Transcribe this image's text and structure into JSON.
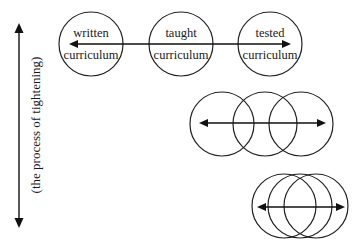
{
  "axis": {
    "label": "(the process of tightening)",
    "direction": "bidirectional-vertical"
  },
  "rows": [
    {
      "name": "separated",
      "circles": [
        {
          "label_top": "written",
          "label_bottom": "curriculum"
        },
        {
          "label_top": "taught",
          "label_bottom": "curriculum"
        },
        {
          "label_top": "tested",
          "label_bottom": "curriculum"
        }
      ]
    },
    {
      "name": "overlapping",
      "circles": [
        {},
        {},
        {}
      ]
    },
    {
      "name": "tightly-overlapping",
      "circles": [
        {},
        {},
        {}
      ]
    }
  ],
  "colors": {
    "stroke": "#222222",
    "background": "#ffffff"
  }
}
